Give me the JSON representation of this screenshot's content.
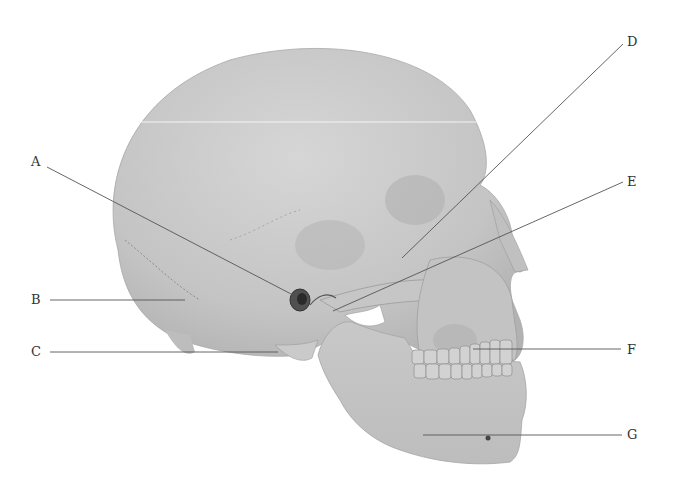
{
  "figure": {
    "labels": [
      {
        "id": "A",
        "text": "A",
        "x": 31,
        "y": 155
      },
      {
        "id": "B",
        "text": "B",
        "x": 31,
        "y": 293
      },
      {
        "id": "C",
        "text": "C",
        "x": 31,
        "y": 345
      },
      {
        "id": "D",
        "text": "D",
        "x": 627,
        "y": 35
      },
      {
        "id": "E",
        "text": "E",
        "x": 627,
        "y": 175
      },
      {
        "id": "F",
        "text": "F",
        "x": 627,
        "y": 343
      },
      {
        "id": "G",
        "text": "G",
        "x": 627,
        "y": 428
      }
    ],
    "leader_color": "#555555",
    "bone_color": "#c9c9c9"
  }
}
